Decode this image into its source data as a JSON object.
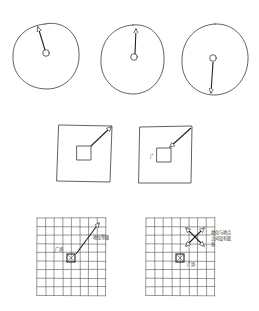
{
  "diagram": {
    "type": "hand-drawn urban design concept sketch",
    "rows": [
      {
        "name": "circles",
        "panels": [
          {
            "id": "circle-1",
            "description": "circle with center node and arrow pointing up-left to edge"
          },
          {
            "id": "circle-2",
            "description": "circle with center node and arrow pointing up to edge"
          },
          {
            "id": "circle-3",
            "description": "circle with center node and arrow pointing down to edge"
          }
        ]
      },
      {
        "name": "squares",
        "panels": [
          {
            "id": "square-1",
            "description": "square with inner square and diagonal arrow from inner corner to outer corner"
          },
          {
            "id": "square-2",
            "description": "square with inner square, small mark, and diagonal arrow pointing toward inner square"
          }
        ]
      },
      {
        "name": "grids",
        "panels": [
          {
            "id": "grid-1",
            "plaza_label": "广场",
            "arrow_label": "地位等级",
            "description": "grid with plaza cell and outward diagonal arrow"
          },
          {
            "id": "grid-2",
            "plaza_label": "广场",
            "arrow_label": "地位与地点之间没有联系",
            "description": "grid with plaza cell and crossed bidirectional arrows"
          }
        ]
      }
    ],
    "square_2_mark": "广"
  },
  "colors": {
    "ink": "#3a3a3a",
    "background": "#ffffff"
  }
}
